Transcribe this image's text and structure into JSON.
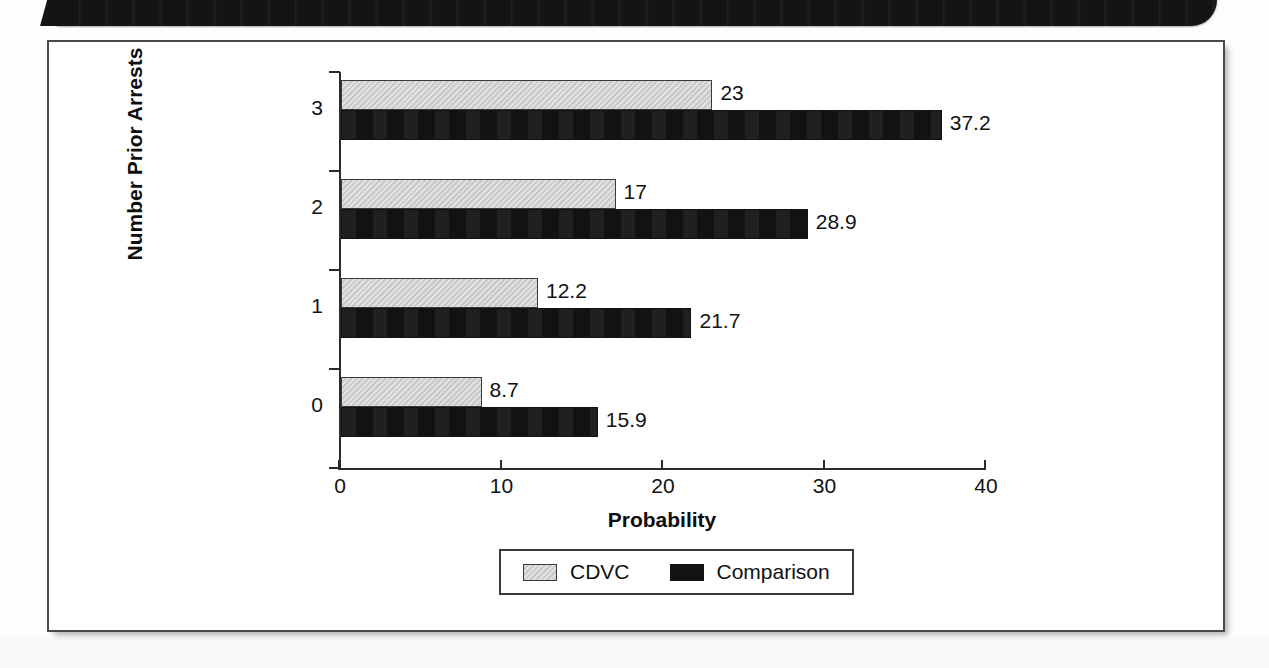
{
  "page": {
    "background_color": "#fdfdfd",
    "header_band_color": "#141414",
    "frame_border_color": "#4a4a4a"
  },
  "chart_data": {
    "type": "bar",
    "orientation": "horizontal",
    "title": "",
    "xlabel": "Probability",
    "ylabel": "Number Prior Arrests",
    "categories": [
      "0",
      "1",
      "2",
      "3"
    ],
    "series": [
      {
        "name": "CDVC",
        "color": "#c9c9c9",
        "values": [
          8.7,
          12.2,
          17,
          23
        ],
        "labels": [
          "8.7",
          "12.2",
          "17",
          "23"
        ]
      },
      {
        "name": "Comparison",
        "color": "#121212",
        "values": [
          15.9,
          21.7,
          28.9,
          37.2
        ],
        "labels": [
          "15.9",
          "21.7",
          "28.9",
          "37.2"
        ]
      }
    ],
    "xlim": [
      0,
      40
    ],
    "xticks": [
      0,
      10,
      20,
      30,
      40
    ],
    "xtick_labels": [
      "0",
      "10",
      "20",
      "30",
      "40"
    ],
    "ytick_labels": [
      "3",
      "2",
      "1",
      "0"
    ],
    "grid": false,
    "legend_position": "bottom-center",
    "legend_entries": [
      "CDVC",
      "Comparison"
    ]
  }
}
